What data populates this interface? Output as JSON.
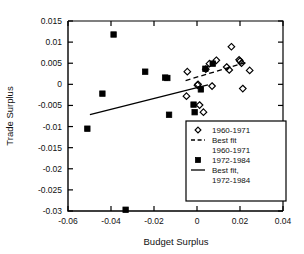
{
  "chart_data": {
    "type": "scatter",
    "title": "",
    "xlabel": "Budget Surplus",
    "ylabel": "Trade Surplus",
    "xlim": [
      -0.06,
      0.04
    ],
    "ylim": [
      -0.03,
      0.015
    ],
    "xticks": [
      -0.06,
      -0.04,
      -0.02,
      0,
      0.02,
      0.04
    ],
    "xticklabels": [
      "-0.06",
      "-0.04",
      "-0.02",
      "0",
      "0.02",
      "0.04"
    ],
    "yticks": [
      0.015,
      0.01,
      0.005,
      0,
      -0.005,
      -0.01,
      -0.015,
      -0.02,
      -0.025,
      -0.03
    ],
    "yticklabels": [
      "0.015",
      "0.01",
      "0.005",
      "0",
      "-0.005",
      "-0.01",
      "-0.015",
      "-0.02",
      "-0.025",
      "-0.03"
    ],
    "grid": false,
    "legend_position": "lower right",
    "series": [
      {
        "name": "1960-1971",
        "marker": "open-diamond",
        "points": [
          [
            -0.0049,
            -0.0028
          ],
          [
            -0.0045,
            0.003
          ],
          [
            0.0005,
            0.0
          ],
          [
            0.0002,
            -0.0002
          ],
          [
            0.0012,
            -0.0049
          ],
          [
            0.003,
            -0.0066
          ],
          [
            0.007,
            -0.0004
          ],
          [
            0.0058,
            0.0049
          ],
          [
            0.0041,
            0.0036
          ],
          [
            0.009,
            0.0057
          ],
          [
            0.0138,
            0.0041
          ],
          [
            0.015,
            0.0034
          ],
          [
            0.016,
            0.0089
          ],
          [
            0.0196,
            0.0058
          ],
          [
            0.02,
            0.0055
          ],
          [
            0.0207,
            0.005
          ],
          [
            0.0213,
            -0.001
          ],
          [
            0.0245,
            0.0033
          ]
        ]
      },
      {
        "name": "1972-1984",
        "marker": "filled-square",
        "points": [
          [
            -0.051,
            -0.0105
          ],
          [
            -0.044,
            -0.0022
          ],
          [
            -0.0388,
            0.0118
          ],
          [
            -0.0332,
            -0.0297
          ],
          [
            -0.0241,
            0.003
          ],
          [
            -0.0148,
            0.0016
          ],
          [
            -0.0138,
            0.0015
          ],
          [
            -0.013,
            -0.0072
          ],
          [
            -0.0016,
            -0.0048
          ],
          [
            -0.0011,
            -0.0066
          ],
          [
            0.0018,
            -0.0012
          ],
          [
            0.0039,
            0.0037
          ],
          [
            0.0073,
            0.0049
          ]
        ]
      }
    ],
    "fits": [
      {
        "name": "Best fit 1960-1971",
        "style": "dashed",
        "x0": -0.0053,
        "y0": 0.0009,
        "x1": 0.0228,
        "y1": 0.0052
      },
      {
        "name": "Best fit, 1972-1984",
        "style": "solid",
        "x0": -0.0498,
        "y0": -0.0072,
        "x1": 0.0051,
        "y1": -0.0001
      }
    ]
  },
  "legend": {
    "entries": [
      {
        "label": "1960-1971",
        "kind": "open-diamond"
      },
      {
        "label": "Best fit",
        "label2": "1960-1971",
        "kind": "dashed-line"
      },
      {
        "label": "1972-1984",
        "kind": "filled-square"
      },
      {
        "label": "Best fit,",
        "label2": "1972-1984",
        "kind": "solid-line"
      }
    ]
  },
  "colors": {
    "ink": "#000000",
    "background": "#ffffff"
  }
}
